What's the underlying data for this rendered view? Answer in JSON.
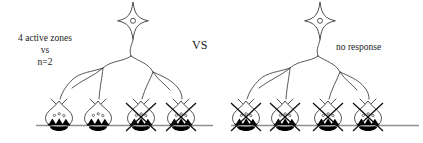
{
  "figure": {
    "background_color": "#ffffff",
    "line_color": "#3a3a3a",
    "baseline_color": "#8f8f8f",
    "fill_color": "#000000",
    "width": 423,
    "height": 143
  },
  "center_label": {
    "text": "VS"
  },
  "left_panel": {
    "label": {
      "line1": "4 active zones",
      "line2": "vs",
      "line3": "n=2"
    },
    "soma": {
      "icon": "four-pointed-star-neuron-icon",
      "nucleus": "nucleus-circle-icon"
    },
    "terminals": [
      {
        "index": 1,
        "crossed_out": false,
        "vesicle_count": 3,
        "active_zone_count": 3
      },
      {
        "index": 2,
        "crossed_out": false,
        "vesicle_count": 3,
        "active_zone_count": 3
      },
      {
        "index": 3,
        "crossed_out": true,
        "vesicle_count": 3,
        "active_zone_count": 3
      },
      {
        "index": 4,
        "crossed_out": true,
        "vesicle_count": 3,
        "active_zone_count": 3
      }
    ],
    "active_terminal_count": 2,
    "crossed_terminal_count": 2
  },
  "right_panel": {
    "label": {
      "text": "no response"
    },
    "soma": {
      "icon": "four-pointed-star-neuron-icon",
      "nucleus": "nucleus-circle-icon"
    },
    "terminals": [
      {
        "index": 1,
        "crossed_out": true,
        "vesicle_count": 3,
        "active_zone_count": 3
      },
      {
        "index": 2,
        "crossed_out": true,
        "vesicle_count": 3,
        "active_zone_count": 3
      },
      {
        "index": 3,
        "crossed_out": true,
        "vesicle_count": 3,
        "active_zone_count": 3
      },
      {
        "index": 4,
        "crossed_out": true,
        "vesicle_count": 3,
        "active_zone_count": 3
      }
    ],
    "active_terminal_count": 0,
    "crossed_terminal_count": 4
  }
}
